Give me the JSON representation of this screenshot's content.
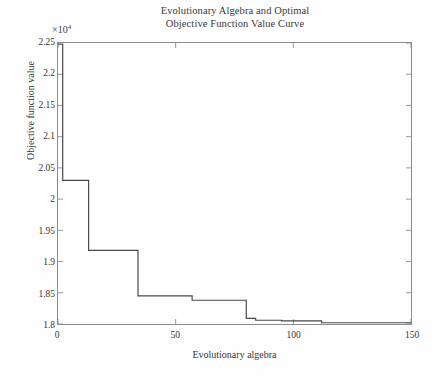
{
  "chart_data": {
    "type": "line",
    "title": "Evolutionary Algebra and Optimal Objective Function Value Curve",
    "title_lines": [
      "Evolutionary Algebra and Optimal",
      "Objective Function Value Curve"
    ],
    "xlabel": "Evolutionary algebra",
    "ylabel": "Objective function value",
    "y_exponent_label": "×10",
    "y_exponent_power": "4",
    "y_scale_factor": 10000,
    "xlim": [
      0,
      150
    ],
    "ylim": [
      1.8,
      2.25
    ],
    "xticks": [
      0,
      50,
      100,
      150
    ],
    "xtick_labels": [
      "0",
      "50",
      "100",
      "150"
    ],
    "yticks": [
      1.8,
      1.85,
      1.9,
      1.95,
      2,
      2.05,
      2.1,
      2.15,
      2.2,
      2.25
    ],
    "ytick_labels": [
      "1.8",
      "1.85",
      "1.9",
      "1.95",
      "2",
      "2.05",
      "2.1",
      "2.15",
      "2.2",
      "2.25"
    ],
    "grid": false,
    "legend": null,
    "line_color": "#4a4a4a",
    "axis_color": "#8b8b8b",
    "step_style": "post",
    "series": [
      {
        "name": "Optimal objective function value",
        "x": [
          0,
          2,
          2,
          13,
          13,
          34,
          34,
          57,
          57,
          80,
          80,
          84,
          84,
          95,
          95,
          112,
          112,
          150
        ],
        "y": [
          2.248,
          2.248,
          2.03,
          2.03,
          1.918,
          1.918,
          1.845,
          1.845,
          1.838,
          1.838,
          1.809,
          1.809,
          1.806,
          1.806,
          1.805,
          1.805,
          1.802,
          1.802
        ]
      }
    ],
    "step_points": [
      {
        "generation": 0,
        "value": 2.248
      },
      {
        "generation": 2,
        "value": 2.03
      },
      {
        "generation": 13,
        "value": 1.918
      },
      {
        "generation": 34,
        "value": 1.845
      },
      {
        "generation": 57,
        "value": 1.838
      },
      {
        "generation": 80,
        "value": 1.809
      },
      {
        "generation": 84,
        "value": 1.806
      },
      {
        "generation": 95,
        "value": 1.805
      },
      {
        "generation": 112,
        "value": 1.802
      },
      {
        "generation": 150,
        "value": 1.802
      }
    ]
  }
}
